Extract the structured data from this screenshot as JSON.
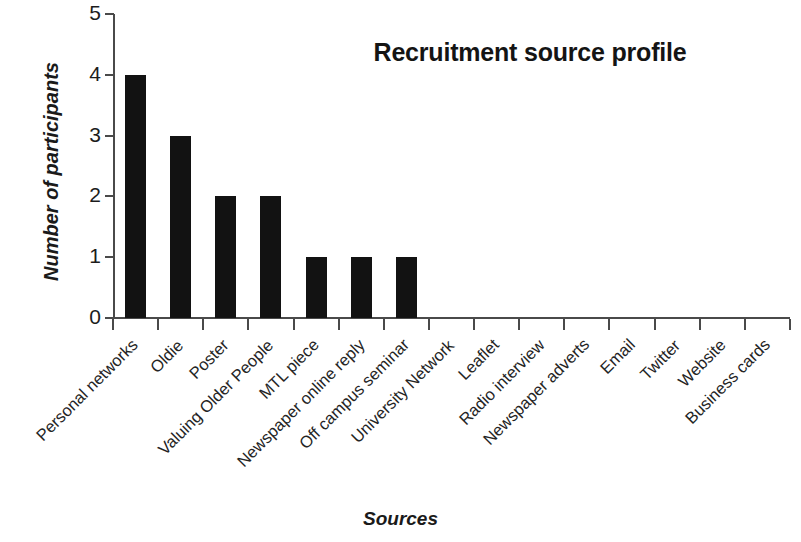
{
  "chart_data": {
    "type": "bar",
    "title": "Recruitment source profile",
    "xlabel": "Sources",
    "ylabel": "Number of participants",
    "categories": [
      "Personal networks",
      "Oldie",
      "Poster",
      "Valuing Older People",
      "MTL piece",
      "Newspaper online reply",
      "Off campus seminar",
      "University Network",
      "Leaflet",
      "Radio interview",
      "Newspaper adverts",
      "Email",
      "Twitter",
      "Website",
      "Business cards"
    ],
    "values": [
      4,
      3,
      2,
      2,
      1,
      1,
      1,
      0,
      0,
      0,
      0,
      0,
      0,
      0,
      0
    ],
    "ylim": [
      0,
      5
    ],
    "yticks": [
      0,
      1,
      2,
      3,
      4,
      5
    ],
    "ytick_labels": [
      "0",
      "1",
      "2",
      "3",
      "4",
      "5"
    ],
    "grid": false,
    "legend": false,
    "bar_color": "#121212",
    "axis_color": "#4a4a4a",
    "background_color": "#ffffff"
  }
}
